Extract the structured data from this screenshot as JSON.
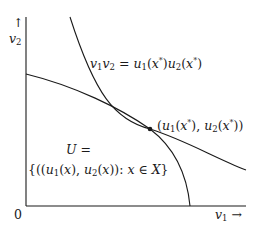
{
  "figure": {
    "origin_label": "0",
    "x_axis_label": "v₁ →",
    "y_axis_label": "↑ v₂",
    "hyperbola_label": "v₁v₂ = u₁(x*)u₂(x*)",
    "point_label": "(u₁(x*), u₂(x*))",
    "set_label_line1": "U =",
    "set_label_line2": "{(u₁(x), u₂(x)): x ∈ X}"
  },
  "colors": {
    "ink": "#1a1a1a",
    "background": "#ffffff"
  }
}
